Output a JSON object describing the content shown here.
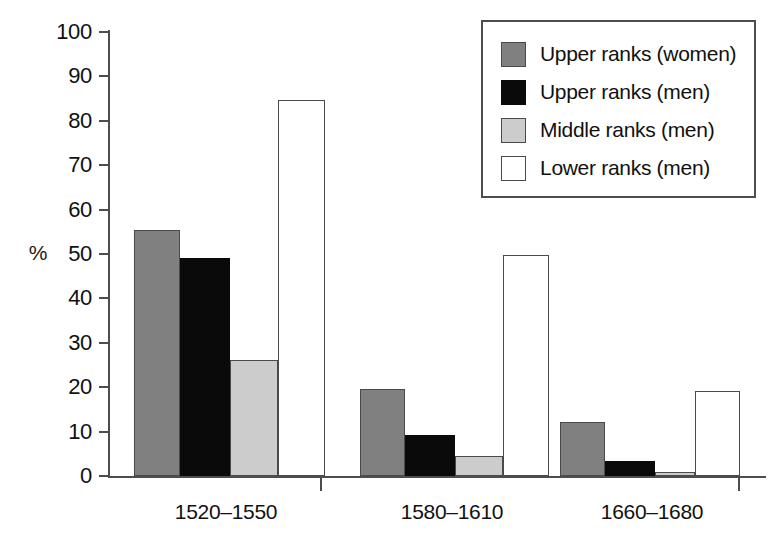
{
  "chart_data": {
    "type": "bar",
    "title": "",
    "xlabel": "",
    "ylabel": "%",
    "ylim": [
      0,
      100
    ],
    "ytick_step": 10,
    "yticks": [
      100,
      90,
      80,
      70,
      60,
      50,
      40,
      30,
      20,
      10,
      0
    ],
    "ytick_labels": [
      "100",
      "90",
      "80",
      "70",
      "60",
      "50",
      "40",
      "30",
      "20",
      "10",
      "0"
    ],
    "grid": false,
    "legend_position": "top-right",
    "categories": [
      "1520–1550",
      "1580–1610",
      "1660–1680"
    ],
    "series": [
      {
        "name": "Upper ranks (women)",
        "swatch": "dark-gray",
        "color": "#808080",
        "values": [
          55.5,
          19.6,
          12.2
        ]
      },
      {
        "name": "Upper ranks (men)",
        "swatch": "black",
        "color": "#0a0a0a",
        "values": [
          49.1,
          9.3,
          3.3
        ]
      },
      {
        "name": "Middle ranks (men)",
        "swatch": "light-gray",
        "color": "#cccccc",
        "values": [
          26.2,
          4.5,
          0.9
        ]
      },
      {
        "name": "Lower ranks (men)",
        "swatch": "white",
        "color": "#ffffff",
        "values": [
          84.6,
          49.8,
          19.2
        ]
      }
    ]
  },
  "legend": {
    "items": [
      {
        "label": "Upper ranks (women)",
        "swatch": "dark-gray"
      },
      {
        "label": "Upper ranks (men)",
        "swatch": "black"
      },
      {
        "label": "Middle ranks (men)",
        "swatch": "light-gray"
      },
      {
        "label": "Lower ranks (men)",
        "swatch": "white"
      }
    ]
  }
}
